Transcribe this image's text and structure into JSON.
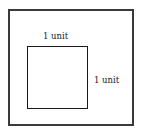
{
  "diagram": {
    "type": "nested-squares",
    "outer_square": {
      "label": ""
    },
    "inner_square": {
      "top_label": "1 unit",
      "right_label": "1 unit"
    },
    "colors": {
      "stroke": "#2a2a2a",
      "background": "#ffffff"
    }
  }
}
